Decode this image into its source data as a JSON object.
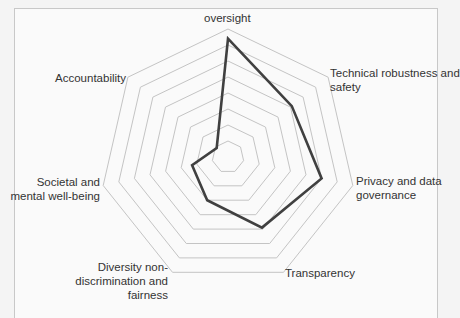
{
  "chart_data": {
    "type": "radar",
    "title": "",
    "axes": [
      "Human agency and oversight",
      "Technical robustness and safety",
      "Privacy and data governance",
      "Transparency",
      "Diversity non-discrimination and fairness",
      "Societal and mental well-being",
      "Accountability"
    ],
    "axis_labels_visible": [
      "oversight",
      "Technical robustness and safety",
      "Privacy and data governance",
      "Transparency",
      "Diversity non-discrimination and fairness",
      "Societal and mental well-being",
      "Accountability"
    ],
    "rings": 8,
    "range": [
      0,
      8
    ],
    "series": [
      {
        "name": "Assessment",
        "values": [
          7.4,
          5.1,
          6.0,
          4.9,
          3.0,
          2.3,
          0.9
        ],
        "color": "#404040"
      }
    ],
    "grid": true,
    "legend": "none"
  },
  "labels": {
    "oversight": "oversight",
    "technical_1": "Technical robustness and",
    "technical_2": "safety",
    "privacy_1": "Privacy and data",
    "privacy_2": "governance",
    "transparency": "Transparency",
    "diversity_1": "Diversity non-",
    "diversity_2": "discrimination and",
    "diversity_3": "fairness",
    "societal_1": "Societal and",
    "societal_2": "mental well-being",
    "accountability": "Accountability"
  },
  "colors": {
    "grid": "#c4c4c4",
    "series": "#404040",
    "text": "#333333"
  }
}
